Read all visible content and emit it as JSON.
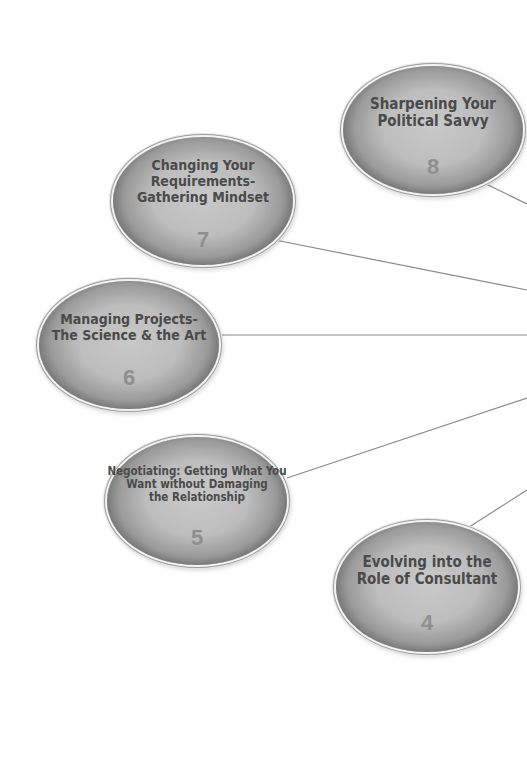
{
  "diagram": {
    "line_color": "#8a8a8a",
    "nodes": [
      {
        "id": "8",
        "number": "8",
        "title_lines": [
          "Sharpening Your",
          "Political Savvy"
        ]
      },
      {
        "id": "7",
        "number": "7",
        "title_lines": [
          "Changing Your",
          "Requirements-",
          "Gathering Mindset"
        ]
      },
      {
        "id": "6",
        "number": "6",
        "title_lines": [
          "Managing Projects-",
          "The Science & the Art"
        ]
      },
      {
        "id": "5",
        "number": "5",
        "title_lines": [
          "Negotiating: Getting What You",
          "Want without Damaging",
          "the Relationship"
        ]
      },
      {
        "id": "4",
        "number": "4",
        "title_lines": [
          "Evolving into the",
          "Role of Consultant"
        ]
      }
    ],
    "connectors": [
      {
        "from": "8",
        "x1": 484,
        "y1": 183,
        "x2": 527,
        "y2": 204
      },
      {
        "from": "7",
        "x1": 275,
        "y1": 240,
        "x2": 527,
        "y2": 290
      },
      {
        "from": "6",
        "x1": 222,
        "y1": 335,
        "x2": 527,
        "y2": 335
      },
      {
        "from": "5",
        "x1": 287,
        "y1": 478,
        "x2": 527,
        "y2": 398
      },
      {
        "from": "4",
        "x1": 466,
        "y1": 529,
        "x2": 527,
        "y2": 490
      }
    ]
  }
}
